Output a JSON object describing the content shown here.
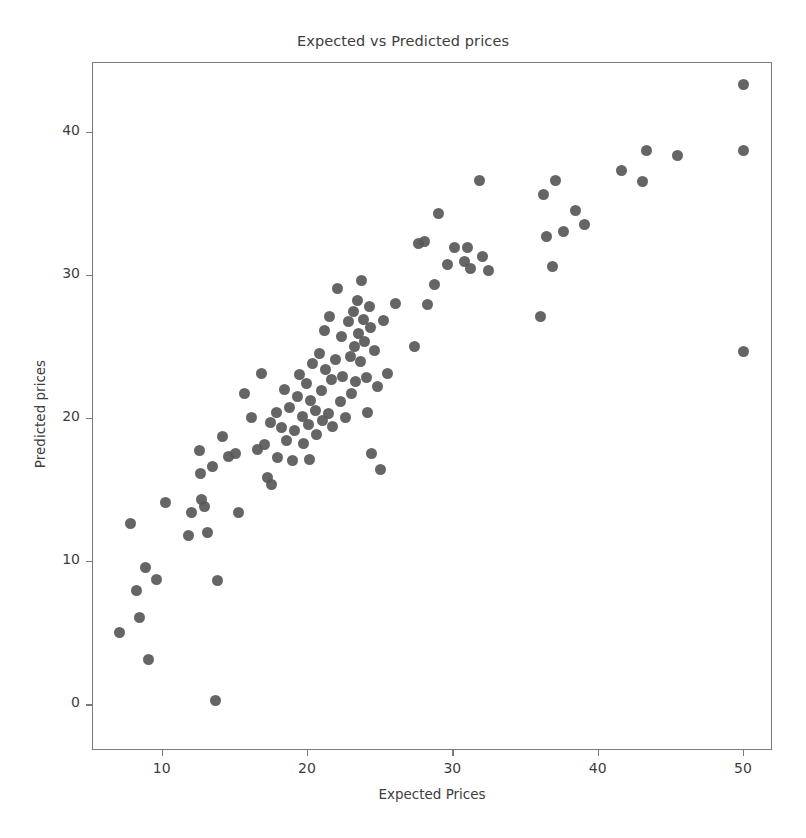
{
  "chart_data": {
    "type": "scatter",
    "title": "Expected vs Predicted prices",
    "xlabel": "Expected Prices",
    "ylabel": "Predicted prices",
    "xlim": [
      5.2,
      52.0
    ],
    "ylim": [
      -3.2,
      44.9
    ],
    "xticks": [
      10,
      20,
      30,
      40,
      50
    ],
    "yticks": [
      0,
      10,
      20,
      30,
      40
    ],
    "xticklabels": [
      "10",
      "20",
      "30",
      "40",
      "50"
    ],
    "yticklabels": [
      "0",
      "10",
      "20",
      "30",
      "40"
    ],
    "grid": false,
    "legend": null,
    "marker": {
      "shape": "circle",
      "color": "#585858",
      "size_px": 11
    },
    "series": [
      {
        "name": "predictions",
        "points": [
          [
            7.0,
            5.1
          ],
          [
            7.8,
            12.7
          ],
          [
            8.2,
            8.0
          ],
          [
            8.4,
            6.1
          ],
          [
            8.8,
            9.6
          ],
          [
            9.0,
            3.2
          ],
          [
            9.6,
            8.8
          ],
          [
            10.2,
            14.2
          ],
          [
            11.8,
            11.9
          ],
          [
            12.0,
            13.5
          ],
          [
            12.5,
            17.8
          ],
          [
            12.6,
            16.2
          ],
          [
            12.7,
            14.4
          ],
          [
            12.9,
            13.9
          ],
          [
            13.1,
            12.1
          ],
          [
            13.4,
            16.7
          ],
          [
            13.6,
            0.3
          ],
          [
            13.8,
            8.7
          ],
          [
            14.1,
            18.8
          ],
          [
            14.5,
            17.4
          ],
          [
            15.0,
            17.6
          ],
          [
            15.2,
            13.5
          ],
          [
            15.6,
            21.8
          ],
          [
            16.1,
            20.1
          ],
          [
            16.5,
            17.9
          ],
          [
            16.8,
            23.2
          ],
          [
            17.0,
            18.2
          ],
          [
            17.2,
            15.9
          ],
          [
            17.4,
            19.8
          ],
          [
            17.5,
            15.4
          ],
          [
            17.8,
            20.5
          ],
          [
            17.9,
            17.3
          ],
          [
            18.2,
            19.4
          ],
          [
            18.4,
            22.1
          ],
          [
            18.5,
            18.5
          ],
          [
            18.7,
            20.8
          ],
          [
            18.9,
            17.1
          ],
          [
            19.1,
            19.2
          ],
          [
            19.3,
            21.6
          ],
          [
            19.4,
            23.1
          ],
          [
            19.6,
            20.2
          ],
          [
            19.7,
            18.3
          ],
          [
            19.9,
            22.5
          ],
          [
            20.0,
            19.6
          ],
          [
            20.1,
            17.2
          ],
          [
            20.2,
            21.3
          ],
          [
            20.3,
            23.9
          ],
          [
            20.5,
            20.6
          ],
          [
            20.6,
            18.9
          ],
          [
            20.8,
            24.6
          ],
          [
            20.9,
            22.0
          ],
          [
            21.0,
            19.9
          ],
          [
            21.1,
            26.2
          ],
          [
            21.2,
            23.5
          ],
          [
            21.4,
            20.4
          ],
          [
            21.5,
            27.2
          ],
          [
            21.6,
            22.8
          ],
          [
            21.7,
            19.5
          ],
          [
            21.9,
            24.2
          ],
          [
            22.0,
            29.1
          ],
          [
            22.2,
            21.2
          ],
          [
            22.3,
            25.8
          ],
          [
            22.4,
            23.0
          ],
          [
            22.6,
            20.1
          ],
          [
            22.8,
            26.8
          ],
          [
            22.9,
            24.4
          ],
          [
            23.0,
            21.8
          ],
          [
            23.1,
            27.5
          ],
          [
            23.2,
            25.1
          ],
          [
            23.3,
            22.6
          ],
          [
            23.4,
            28.3
          ],
          [
            23.5,
            26.0
          ],
          [
            23.6,
            24.0
          ],
          [
            23.7,
            29.7
          ],
          [
            23.8,
            27.0
          ],
          [
            23.9,
            25.4
          ],
          [
            24.0,
            22.9
          ],
          [
            24.1,
            20.5
          ],
          [
            24.2,
            27.9
          ],
          [
            24.3,
            26.4
          ],
          [
            24.4,
            17.6
          ],
          [
            24.6,
            24.8
          ],
          [
            24.8,
            22.3
          ],
          [
            25.0,
            16.5
          ],
          [
            25.2,
            26.9
          ],
          [
            25.5,
            23.2
          ],
          [
            26.0,
            28.1
          ],
          [
            27.3,
            25.1
          ],
          [
            27.6,
            32.3
          ],
          [
            28.0,
            32.4
          ],
          [
            28.2,
            28.0
          ],
          [
            28.7,
            29.4
          ],
          [
            29.0,
            34.4
          ],
          [
            29.6,
            30.8
          ],
          [
            30.1,
            32.0
          ],
          [
            30.8,
            31.0
          ],
          [
            31.0,
            32.0
          ],
          [
            31.2,
            30.5
          ],
          [
            31.8,
            36.7
          ],
          [
            32.0,
            31.4
          ],
          [
            32.4,
            30.4
          ],
          [
            36.0,
            27.2
          ],
          [
            36.2,
            35.7
          ],
          [
            36.4,
            32.8
          ],
          [
            36.8,
            30.7
          ],
          [
            37.0,
            36.7
          ],
          [
            37.6,
            33.1
          ],
          [
            38.4,
            34.6
          ],
          [
            39.0,
            33.6
          ],
          [
            41.6,
            37.4
          ],
          [
            43.0,
            36.6
          ],
          [
            43.3,
            38.8
          ],
          [
            45.4,
            38.4
          ],
          [
            50.0,
            43.4
          ],
          [
            50.0,
            38.8
          ],
          [
            50.0,
            24.7
          ]
        ]
      }
    ]
  }
}
